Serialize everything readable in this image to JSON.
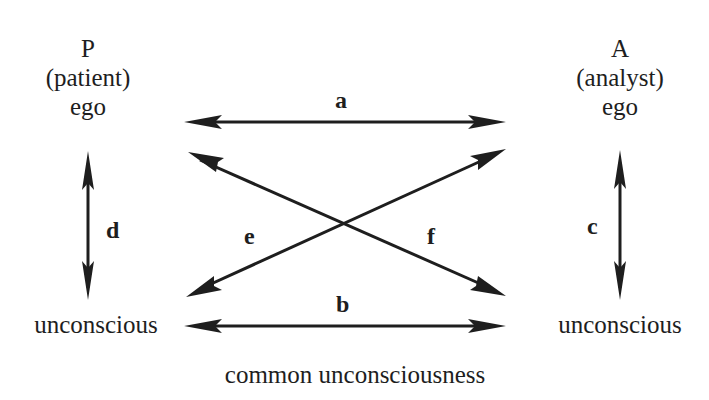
{
  "diagram": {
    "nodes": {
      "patient_ego": {
        "letter": "P",
        "role": "(patient)",
        "level": "ego"
      },
      "analyst_ego": {
        "letter": "A",
        "role": "(analyst)",
        "level": "ego"
      },
      "patient_unconscious": {
        "label": "unconscious"
      },
      "analyst_unconscious": {
        "label": "unconscious"
      }
    },
    "edges": {
      "a": {
        "label": "a",
        "from": "patient_ego",
        "to": "analyst_ego"
      },
      "b": {
        "label": "b",
        "from": "patient_unconscious",
        "to": "analyst_unconscious"
      },
      "c": {
        "label": "c",
        "from": "analyst_ego",
        "to": "analyst_unconscious"
      },
      "d": {
        "label": "d",
        "from": "patient_ego",
        "to": "patient_unconscious"
      },
      "e": {
        "label": "e",
        "from": "patient_unconscious",
        "to": "analyst_ego"
      },
      "f": {
        "label": "f",
        "from": "patient_ego",
        "to": "analyst_unconscious"
      }
    },
    "caption": "common unconsciousness"
  }
}
